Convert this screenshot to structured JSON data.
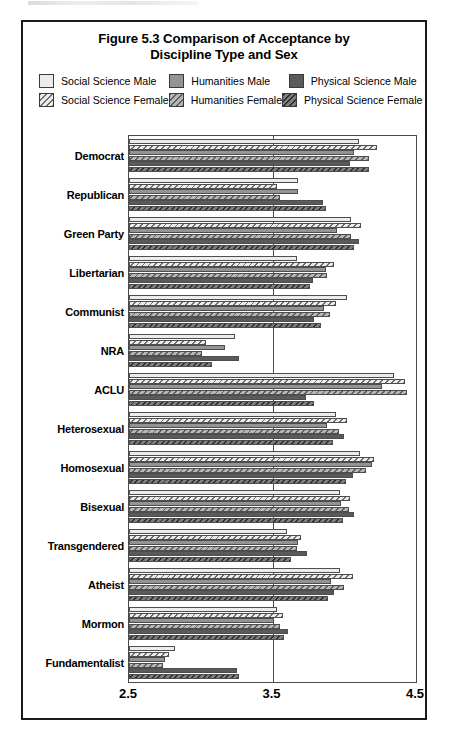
{
  "figure": {
    "title_line1": "Figure 5.3 Comparison of Acceptance by",
    "title_line2": "Discipline Type and Sex"
  },
  "legend": {
    "items": [
      {
        "key": "ssm",
        "label": "Social Science Male",
        "fill": "#ececec",
        "hatched": false,
        "column": 1,
        "row": 1
      },
      {
        "key": "hm",
        "label": "Humanities Male",
        "fill": "#949494",
        "hatched": false,
        "column": 2,
        "row": 1
      },
      {
        "key": "pm",
        "label": "Physical Science Male",
        "fill": "#5a5a5a",
        "hatched": false,
        "column": 3,
        "row": 1
      },
      {
        "key": "ssf",
        "label": "Social Science Female",
        "fill": "#ececec",
        "hatched": true,
        "column": 1,
        "row": 2
      },
      {
        "key": "hf",
        "label": "Humanities Female",
        "fill": "#b7b7b7",
        "hatched": true,
        "column": 2,
        "row": 2
      },
      {
        "key": "pf",
        "label": "Physical Science Female",
        "fill": "#7d7d7d",
        "hatched": true,
        "column": 3,
        "row": 2
      }
    ]
  },
  "chart_data": {
    "type": "bar",
    "orientation": "horizontal",
    "title": "Figure 5.3 Comparison of Acceptance by Discipline Type and Sex",
    "xlabel": "",
    "ylabel": "",
    "xlim": [
      2.5,
      4.5
    ],
    "xticks": [
      2.5,
      3.5,
      4.5
    ],
    "xtick_labels": [
      "2.5",
      "3.5",
      "4.5"
    ],
    "grid": true,
    "gridlines_at": [
      3.5
    ],
    "legend_position": "top",
    "categories": [
      "Democrat",
      "Republican",
      "Green Party",
      "Libertarian",
      "Communist",
      "NRA",
      "ACLU",
      "Heterosexual",
      "Homosexual",
      "Bisexual",
      "Transgendered",
      "Atheist",
      "Mormon",
      "Fundamentalist"
    ],
    "series": [
      {
        "name": "Social Science Male",
        "key": "ssm",
        "values": [
          4.1,
          3.68,
          4.05,
          3.67,
          4.02,
          3.24,
          4.35,
          3.94,
          4.11,
          3.97,
          3.6,
          3.97,
          3.53,
          2.82
        ]
      },
      {
        "name": "Social Science Female",
        "key": "ssf",
        "values": [
          4.23,
          3.53,
          4.12,
          3.93,
          3.94,
          3.04,
          4.42,
          4.02,
          4.21,
          4.04,
          3.7,
          4.06,
          3.57,
          2.78
        ]
      },
      {
        "name": "Humanities Male",
        "key": "hm",
        "values": [
          4.07,
          3.68,
          3.95,
          3.87,
          3.86,
          3.17,
          4.26,
          3.88,
          4.19,
          3.98,
          3.68,
          3.91,
          3.51,
          2.75
        ]
      },
      {
        "name": "Humanities Female",
        "key": "hf",
        "values": [
          4.17,
          3.55,
          4.05,
          3.88,
          3.9,
          3.01,
          4.44,
          3.96,
          4.15,
          4.03,
          3.67,
          4.0,
          3.55,
          2.74
        ]
      },
      {
        "name": "Physical Science Male",
        "key": "pm",
        "values": [
          4.04,
          3.85,
          4.1,
          3.78,
          3.79,
          3.27,
          3.73,
          4.0,
          4.06,
          4.07,
          3.74,
          3.93,
          3.61,
          3.25
        ]
      },
      {
        "name": "Physical Science Female",
        "key": "pf",
        "values": [
          4.17,
          3.87,
          4.07,
          3.76,
          3.84,
          3.08,
          3.79,
          3.92,
          4.01,
          3.99,
          3.63,
          3.89,
          3.58,
          3.27
        ]
      }
    ]
  }
}
